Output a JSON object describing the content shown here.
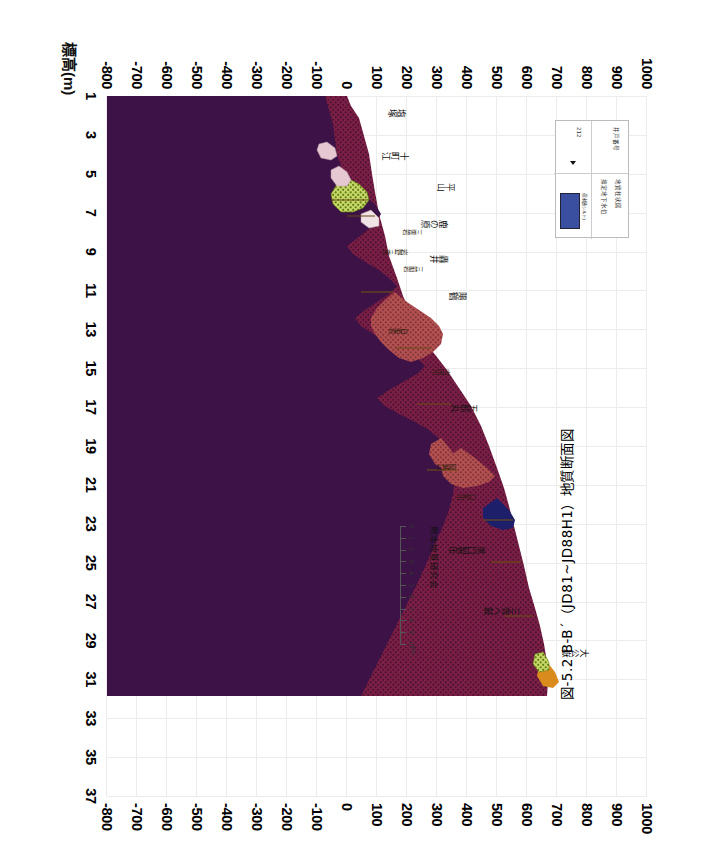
{
  "figure": {
    "caption": "図-5.2  B-B´（JD81~JD88H1）地質断面図",
    "organization": "熊本地質研究会"
  },
  "axes": {
    "elevation": {
      "title": "標高(m)",
      "unit": "m",
      "ticks": [
        "1000",
        "900",
        "800",
        "700",
        "600",
        "500",
        "400",
        "300",
        "200",
        "100",
        "0",
        "-100",
        "-200",
        "-300",
        "-400",
        "-500",
        "-600",
        "-700",
        "-800"
      ],
      "min": -800,
      "max": 1000,
      "step": 100
    },
    "distance": {
      "ticks": [
        "1",
        "3",
        "5",
        "7",
        "9",
        "11",
        "13",
        "15",
        "17",
        "19",
        "21",
        "23",
        "25",
        "27",
        "29",
        "31",
        "33",
        "35",
        "37"
      ],
      "min": 1,
      "max": 37,
      "step": 2
    }
  },
  "scalebar": {
    "ticks": [
      "0",
      "1",
      "2",
      "3",
      "4",
      "5",
      "6",
      "7",
      "8",
      "9",
      "10"
    ],
    "unit": "km"
  },
  "legend": {
    "rows": [
      "井戸番号",
      "地質柱状図",
      "推定地下水位"
    ],
    "sample_number": "212",
    "swatch_caption": "帯水層(シルト)",
    "swatch_color": "#3b4fa0"
  },
  "colors": {
    "maroon_dotted": "#7c1f46",
    "deep_purple": "#3d1247",
    "brick_red": "#b35050",
    "navy": "#1d1f6b",
    "olive_green": "#9aba3a",
    "pale_pink": "#e6c8d2",
    "orange": "#d98b1e",
    "grid": "#ececec"
  },
  "place_labels": [
    {
      "text": "塩塚",
      "x": 1.8,
      "y": 190
    },
    {
      "text": "十町江",
      "x": 4.0,
      "y": 200
    },
    {
      "text": "平山",
      "x": 5.6,
      "y": 355
    },
    {
      "text": "鹿の原",
      "x": 7.5,
      "y": 330
    },
    {
      "text": "轟井",
      "x": 9.3,
      "y": 330
    },
    {
      "text": "陽鶴",
      "x": 11.2,
      "y": 395
    },
    {
      "text": "五郎丸",
      "x": 17.0,
      "y": 430
    },
    {
      "text": "黒口製缶",
      "x": 24.3,
      "y": 455
    },
    {
      "text": "三舎ヘ鼓",
      "x": 27.4,
      "y": 570
    },
    {
      "text": "大公嶽",
      "x": 29.6,
      "y": 800
    }
  ],
  "unit_labels": [
    {
      "text": "岩野三舎",
      "x": 9.0,
      "y": 205
    },
    {
      "text": "三舎岩",
      "x": 8.0,
      "y": 250
    },
    {
      "text": "三前岩",
      "x": 9.9,
      "y": 255
    },
    {
      "text": "白亜岩",
      "x": 13.1,
      "y": 205
    },
    {
      "text": "内田川",
      "x": 15.2,
      "y": 345
    },
    {
      "text": "阿蘇口",
      "x": 20.1,
      "y": 365
    },
    {
      "text": "口蛇山",
      "x": 21.6,
      "y": 430
    }
  ]
}
